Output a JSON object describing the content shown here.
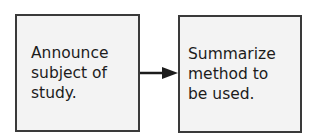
{
  "diagram": {
    "type": "flowchart",
    "nodes": [
      {
        "id": "step1",
        "label": "Announce\nsubject of\nstudy."
      },
      {
        "id": "step2",
        "label": "Summarize\nmethod to\nbe used."
      }
    ],
    "edges": [
      {
        "from": "step1",
        "to": "step2",
        "style": "arrow"
      }
    ],
    "colors": {
      "border": "#3a3a3a",
      "fill": "#f3f3f3",
      "text": "#1c1c1c"
    }
  }
}
